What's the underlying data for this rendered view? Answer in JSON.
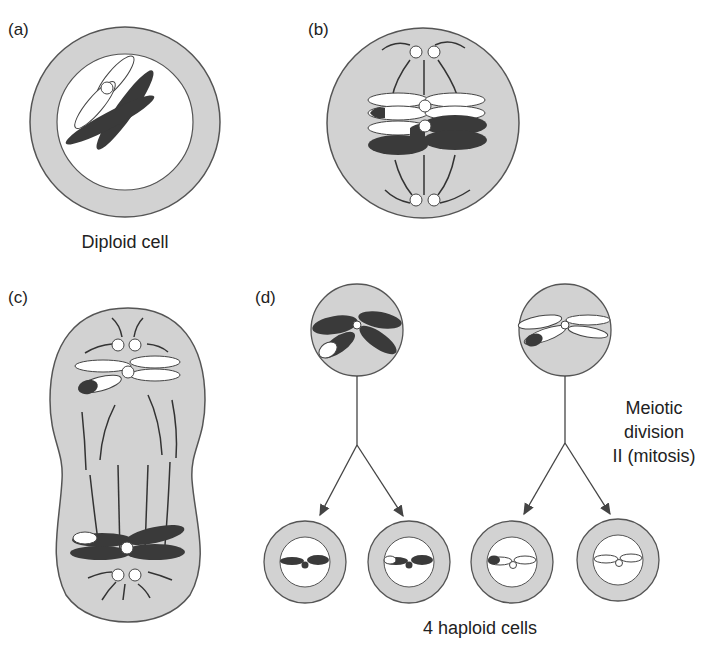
{
  "header_fragment": "Meiin",
  "panels": {
    "a": {
      "label": "(a)",
      "caption": "Diploid cell"
    },
    "b": {
      "label": "(b)"
    },
    "c": {
      "label": "(c)"
    },
    "d": {
      "label": "(d)",
      "side_caption": [
        "Meiotic",
        "division",
        "II (mitosis)"
      ],
      "bottom_caption": "4 haploid cells"
    }
  },
  "colors": {
    "cell_fill": "#d2d2d2",
    "outline": "#555555",
    "dark_chromosome": "#3a3a3a",
    "light_chromosome": "#ffffff"
  }
}
